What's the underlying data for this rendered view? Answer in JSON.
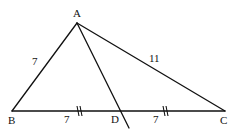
{
  "diagram": {
    "type": "triangle-median",
    "points": {
      "A": {
        "label": "A",
        "x": 77,
        "y": 23
      },
      "B": {
        "label": "B",
        "x": 12,
        "y": 111
      },
      "C": {
        "label": "C",
        "x": 225,
        "y": 111
      },
      "D": {
        "label": "D",
        "x": 120,
        "y": 111
      }
    },
    "segments": [
      {
        "from": "A",
        "to": "B",
        "length_label": "7"
      },
      {
        "from": "A",
        "to": "C",
        "length_label": "11"
      },
      {
        "from": "B",
        "to": "D",
        "length_label": "7",
        "tick_marks": 2
      },
      {
        "from": "D",
        "to": "C",
        "length_label": "7",
        "tick_marks": 2
      },
      {
        "from": "A",
        "to": "D",
        "length_label": "",
        "extended": true
      }
    ],
    "labels": {
      "A": "A",
      "B": "B",
      "C": "C",
      "D": "D",
      "AB": "7",
      "AC": "11",
      "BD": "7",
      "DC": "7"
    },
    "stroke_color": "#111111",
    "background": "#ffffff"
  }
}
